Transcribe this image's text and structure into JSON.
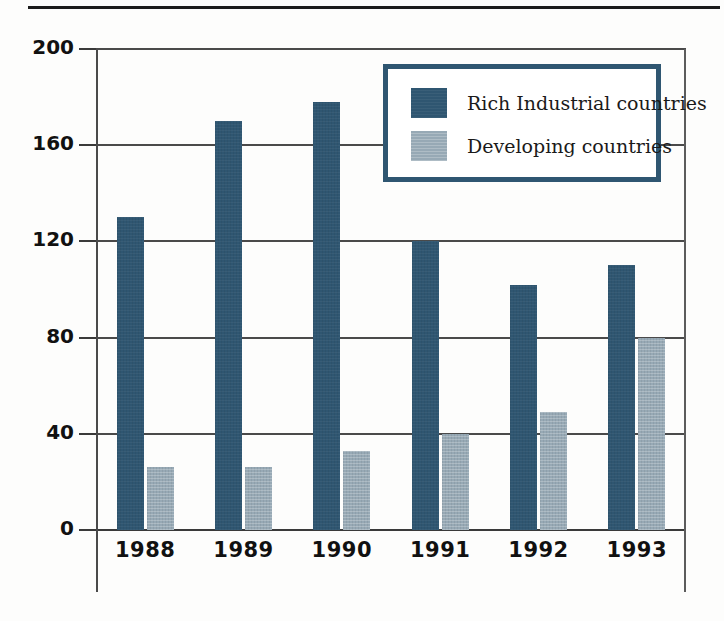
{
  "figure": {
    "top_rule": "horizontal-rule"
  },
  "chart_data": {
    "type": "bar",
    "title": "",
    "subtitle": "",
    "xlabel": "",
    "ylabel": "",
    "categories": [
      "1988",
      "1989",
      "1990",
      "1991",
      "1992",
      "1993"
    ],
    "series": [
      {
        "name": "Rich Industrial countries",
        "color": "#2f5671",
        "values": [
          130,
          170,
          178,
          120,
          102,
          110
        ]
      },
      {
        "name": "Developing countries",
        "color": "#97a9b5",
        "values": [
          26,
          26,
          33,
          40,
          49,
          80
        ]
      }
    ],
    "ylim": [
      0,
      200
    ],
    "yticks": [
      0,
      40,
      80,
      120,
      160,
      200
    ],
    "ytick_labels": [
      "0",
      "40",
      "80",
      "120",
      "160",
      "200"
    ],
    "grid": true,
    "legend_position": "top-right"
  },
  "legend": {
    "items": [
      {
        "label": "Rich Industrial countries",
        "color": "#2f5671"
      },
      {
        "label": "Developing countries",
        "color": "#97a9b5"
      }
    ],
    "border_color": "#2f5671"
  },
  "colors": {
    "series_dark": "#2f5671",
    "series_light": "#97a9b5",
    "axis": "#4a4a4a",
    "text": "#111111",
    "background": "#ffffff"
  }
}
